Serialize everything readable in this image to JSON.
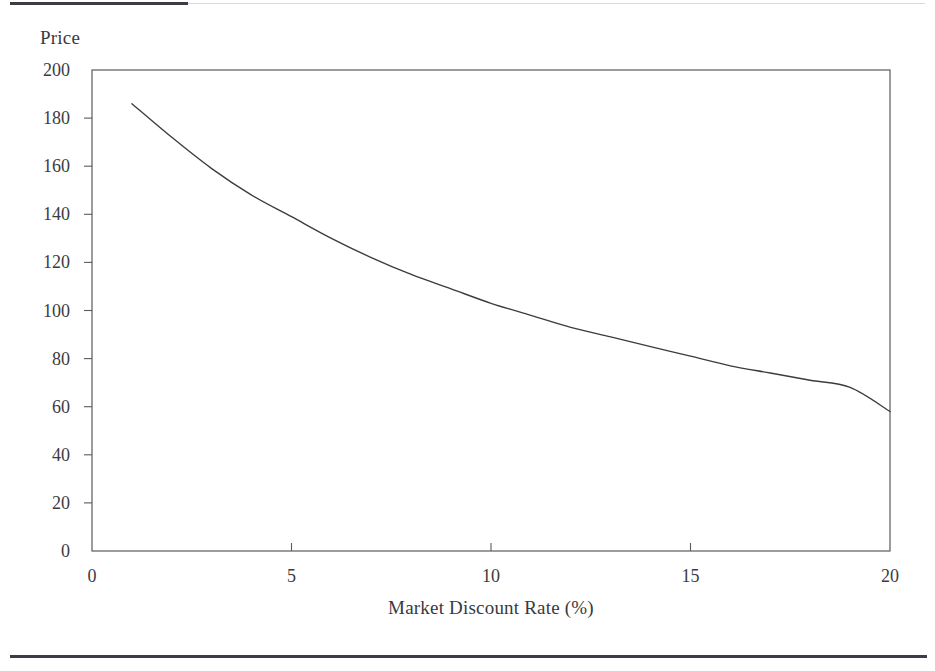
{
  "page": {
    "background_color": "#ffffff",
    "rule_color": "#3c3c44",
    "rule_thin_color": "#d9d9dd"
  },
  "figure": {
    "axis_color": "#5a5a60",
    "curve_color": "#3b3b41",
    "y_axis_title": "Price",
    "x_axis_title": "Market Discount Rate (%)"
  },
  "chart_data": {
    "type": "line",
    "title": "",
    "subtitle": "",
    "xlabel": "Market Discount Rate (%)",
    "ylabel": "Price",
    "xlim": [
      0,
      20
    ],
    "ylim": [
      0,
      200
    ],
    "xticks": [
      0,
      5,
      10,
      15,
      20
    ],
    "yticks": [
      0,
      20,
      40,
      60,
      80,
      100,
      120,
      140,
      160,
      180,
      200
    ],
    "xtick_labels": [
      "0",
      "5",
      "10",
      "15",
      "20"
    ],
    "ytick_labels": [
      "0",
      "20",
      "40",
      "60",
      "80",
      "100",
      "120",
      "140",
      "160",
      "180",
      "200"
    ],
    "grid": false,
    "legend": null,
    "legend_position": "none",
    "annotations": [],
    "series": [
      {
        "name": "Bond price",
        "x": [
          1,
          2,
          3,
          4,
          5,
          6,
          7,
          8,
          9,
          10,
          11,
          12,
          13,
          14,
          15,
          16,
          17,
          18,
          19,
          20
        ],
        "y": [
          186,
          172,
          159,
          148,
          139,
          130,
          122,
          115,
          109,
          103,
          98,
          93,
          89,
          85,
          81,
          77,
          74,
          71,
          68,
          58
        ]
      }
    ]
  }
}
